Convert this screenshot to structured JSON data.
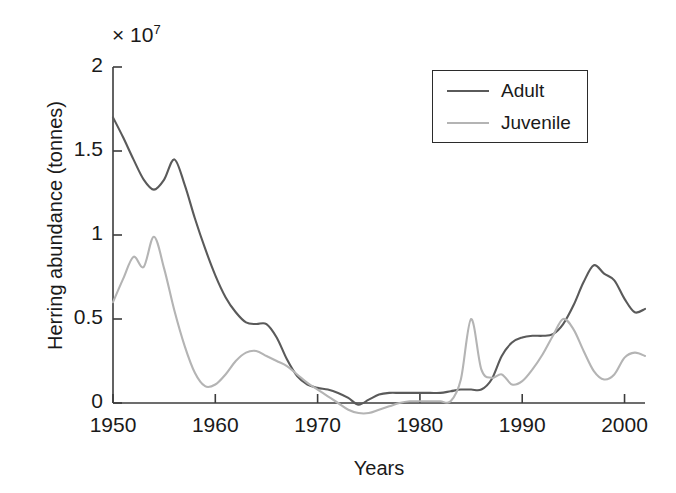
{
  "chart_data": {
    "type": "line",
    "title": "",
    "xlabel": "Years",
    "ylabel": "Herring abundance (tonnes)",
    "y_multiplier_label": "× 10",
    "y_multiplier_exponent": "7",
    "y_scale": 10000000.0,
    "xlim": [
      1950,
      2002
    ],
    "ylim": [
      0,
      2
    ],
    "xticks": [
      1950,
      1960,
      1970,
      1980,
      1990,
      2000
    ],
    "xtick_labels": [
      "1950",
      "1960",
      "1970",
      "1980",
      "1990",
      "2000"
    ],
    "yticks": [
      0,
      0.5,
      1,
      1.5,
      2
    ],
    "ytick_labels": [
      "0",
      "0.5",
      "1",
      "1.5",
      "2"
    ],
    "grid": false,
    "legend_position": "top-right",
    "legend_entries": [
      "Adult",
      "Juvenile"
    ],
    "series": [
      {
        "name": "Adult",
        "color": "#5a5a5a",
        "x": [
          1950,
          1951,
          1952,
          1953,
          1954,
          1955,
          1956,
          1957,
          1958,
          1959,
          1960,
          1961,
          1962,
          1963,
          1964,
          1965,
          1966,
          1967,
          1968,
          1969,
          1970,
          1971,
          1972,
          1973,
          1974,
          1975,
          1976,
          1977,
          1978,
          1979,
          1980,
          1981,
          1982,
          1983,
          1984,
          1985,
          1986,
          1987,
          1988,
          1989,
          1990,
          1991,
          1992,
          1993,
          1994,
          1995,
          1996,
          1997,
          1998,
          1999,
          2000,
          2001,
          2002
        ],
        "values": [
          1.7,
          1.58,
          1.45,
          1.33,
          1.27,
          1.33,
          1.45,
          1.3,
          1.1,
          0.92,
          0.76,
          0.63,
          0.54,
          0.48,
          0.47,
          0.47,
          0.39,
          0.26,
          0.16,
          0.11,
          0.09,
          0.08,
          0.06,
          0.03,
          -0.01,
          0.02,
          0.05,
          0.06,
          0.06,
          0.06,
          0.06,
          0.06,
          0.06,
          0.07,
          0.08,
          0.08,
          0.08,
          0.14,
          0.28,
          0.36,
          0.39,
          0.4,
          0.4,
          0.41,
          0.47,
          0.58,
          0.72,
          0.82,
          0.77,
          0.73,
          0.62,
          0.54,
          0.56
        ]
      },
      {
        "name": "Juvenile",
        "color": "#b4b4b4",
        "x": [
          1950,
          1951,
          1952,
          1953,
          1954,
          1955,
          1956,
          1957,
          1958,
          1959,
          1960,
          1961,
          1962,
          1963,
          1964,
          1965,
          1966,
          1967,
          1968,
          1969,
          1970,
          1971,
          1972,
          1973,
          1974,
          1975,
          1976,
          1977,
          1978,
          1979,
          1980,
          1981,
          1982,
          1983,
          1984,
          1985,
          1986,
          1987,
          1988,
          1989,
          1990,
          1991,
          1992,
          1993,
          1994,
          1995,
          1996,
          1997,
          1998,
          1999,
          2000,
          2001,
          2002
        ],
        "values": [
          0.6,
          0.74,
          0.87,
          0.81,
          0.99,
          0.8,
          0.55,
          0.34,
          0.18,
          0.1,
          0.11,
          0.17,
          0.25,
          0.3,
          0.31,
          0.28,
          0.25,
          0.22,
          0.17,
          0.12,
          0.08,
          0.04,
          0.0,
          -0.04,
          -0.06,
          -0.06,
          -0.04,
          -0.02,
          0.0,
          0.01,
          0.01,
          0.01,
          0.01,
          0.01,
          0.14,
          0.5,
          0.2,
          0.15,
          0.17,
          0.11,
          0.13,
          0.2,
          0.29,
          0.4,
          0.5,
          0.44,
          0.31,
          0.19,
          0.14,
          0.17,
          0.27,
          0.3,
          0.28
        ]
      }
    ]
  },
  "axes": {
    "x_axis_line_color": "#3c3c3c",
    "y_axis_line_color": "#3c3c3c"
  }
}
